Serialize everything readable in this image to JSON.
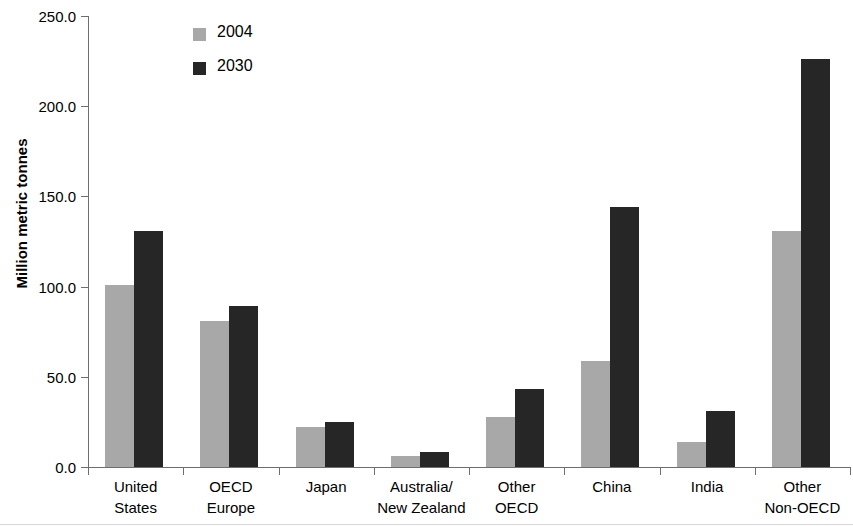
{
  "chart_data": {
    "type": "bar",
    "title": "",
    "subtitle": "",
    "xlabel": "",
    "ylabel": "Million metric tonnes",
    "ylim": [
      0,
      250
    ],
    "ytick_labels": [
      "250.0",
      "200.0",
      "150.0",
      "100.0",
      "50.0",
      "0.0"
    ],
    "ytick_values": [
      250,
      200,
      150,
      100,
      50,
      0
    ],
    "grid": false,
    "legend_position": "top-left-inside",
    "categories": [
      "United\nStates",
      "OECD\nEurope",
      "Japan",
      "Australia/\nNew Zealand",
      "Other\nOECD",
      "China",
      "India",
      "Other\nNon-OECD"
    ],
    "series": [
      {
        "name": "2004",
        "color": "#a8a8a8",
        "values": [
          101,
          81,
          22,
          6,
          28,
          59,
          14,
          131
        ]
      },
      {
        "name": "2030",
        "color": "#262626",
        "values": [
          131,
          89,
          25,
          8.5,
          43,
          144,
          31,
          226
        ]
      }
    ],
    "annotations": []
  },
  "legend": {
    "items": [
      {
        "label": "2004",
        "color": "#a8a8a8",
        "swatch_name": "legend-swatch-2004"
      },
      {
        "label": "2030",
        "color": "#262626",
        "swatch_name": "legend-swatch-2030"
      }
    ]
  },
  "axes": {
    "value_axis_title": "Million metric tonnes",
    "axis_color": "#6e6e6e"
  }
}
